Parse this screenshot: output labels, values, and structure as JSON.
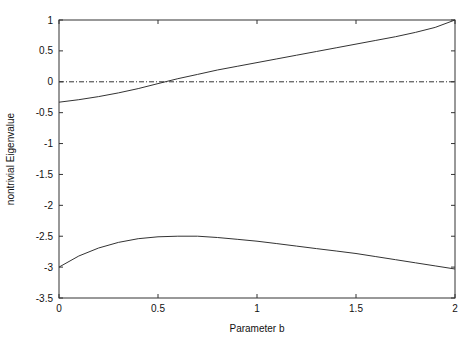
{
  "chart_data": {
    "type": "line",
    "title": "",
    "xlabel": "Parameter b",
    "ylabel": "nontrivial Eigenvalue",
    "xlim": [
      0,
      2
    ],
    "ylim": [
      -3.5,
      1
    ],
    "grid": false,
    "legend": null,
    "x_ticks": [
      0,
      0.5,
      1,
      1.5,
      2
    ],
    "x_tick_labels": [
      "0",
      "0.5",
      "1",
      "1.5",
      "2"
    ],
    "y_ticks": [
      1,
      0.5,
      0,
      -0.5,
      -1,
      -1.5,
      -2,
      -2.5,
      -3,
      -3.5
    ],
    "y_tick_labels": [
      "1",
      "0.5",
      "0",
      "-0.5",
      "-1",
      "-1.5",
      "-2",
      "-2.5",
      "-3",
      "-3.5"
    ],
    "series": [
      {
        "name": "upper eigenvalue",
        "style": "solid",
        "x": [
          0,
          0.1,
          0.2,
          0.3,
          0.4,
          0.5,
          0.6,
          0.7,
          0.8,
          0.9,
          1.0,
          1.1,
          1.2,
          1.3,
          1.4,
          1.5,
          1.6,
          1.7,
          1.8,
          1.9,
          2.0
        ],
        "y": [
          -0.33,
          -0.29,
          -0.24,
          -0.18,
          -0.11,
          -0.03,
          0.05,
          0.12,
          0.19,
          0.25,
          0.31,
          0.37,
          0.43,
          0.49,
          0.55,
          0.61,
          0.67,
          0.73,
          0.8,
          0.88,
          1.0
        ]
      },
      {
        "name": "zero line",
        "style": "dash-dot",
        "x": [
          0,
          2
        ],
        "y": [
          0,
          0
        ]
      },
      {
        "name": "lower eigenvalue",
        "style": "solid",
        "x": [
          0,
          0.1,
          0.2,
          0.3,
          0.4,
          0.5,
          0.6,
          0.7,
          0.8,
          0.9,
          1.0,
          1.1,
          1.2,
          1.3,
          1.4,
          1.5,
          1.6,
          1.7,
          1.8,
          1.9,
          2.0
        ],
        "y": [
          -3.0,
          -2.82,
          -2.69,
          -2.6,
          -2.54,
          -2.51,
          -2.5,
          -2.5,
          -2.52,
          -2.55,
          -2.58,
          -2.62,
          -2.66,
          -2.7,
          -2.74,
          -2.78,
          -2.83,
          -2.88,
          -2.93,
          -2.98,
          -3.03
        ]
      }
    ]
  },
  "colors": {
    "line": "#333333",
    "axis": "#333333",
    "background": "#ffffff"
  }
}
